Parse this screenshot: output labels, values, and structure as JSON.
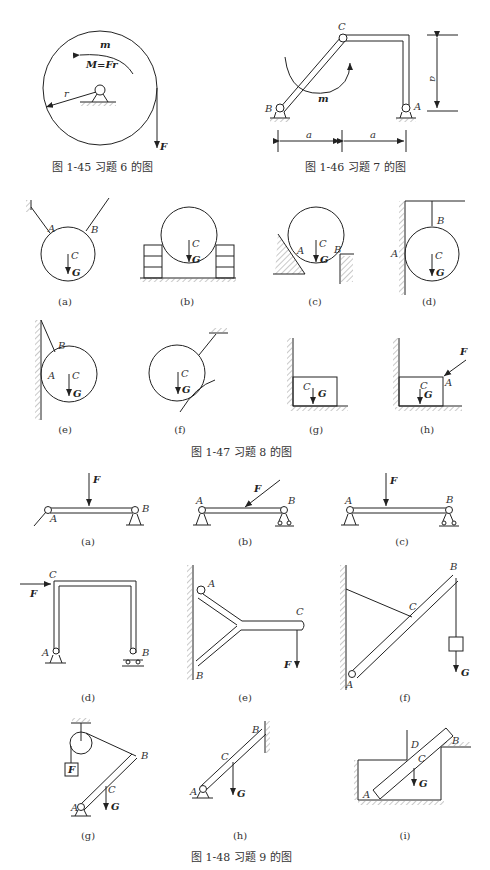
{
  "figures": {
    "fig_1_45": {
      "caption": "图 1-45   习题 6 的图",
      "labels": {
        "moment": "m",
        "equation": "M=Fr",
        "radius": "r",
        "force": "F"
      }
    },
    "fig_1_46": {
      "caption": "图 1-46   习题 7 的图",
      "labels": {
        "C": "C",
        "B": "B",
        "A": "A",
        "moment": "m",
        "dim_vertical": "a",
        "dim_left": "a",
        "dim_right": "a"
      }
    },
    "fig_1_47": {
      "caption": "图 1-47   习题 8 的图",
      "subfigures": [
        "(a)",
        "(b)",
        "(c)",
        "(d)",
        "(e)",
        "(f)",
        "(g)",
        "(h)"
      ],
      "labels": {
        "A": "A",
        "B": "B",
        "C": "C",
        "G": "G",
        "F": "F"
      }
    },
    "fig_1_48": {
      "caption": "图 1-48   习题 9 的图",
      "subfigures": [
        "(a)",
        "(b)",
        "(c)",
        "(d)",
        "(e)",
        "(f)",
        "(g)",
        "(h)",
        "(i)"
      ],
      "labels": {
        "A": "A",
        "B": "B",
        "C": "C",
        "D": "D",
        "F": "F",
        "G": "G"
      }
    }
  }
}
